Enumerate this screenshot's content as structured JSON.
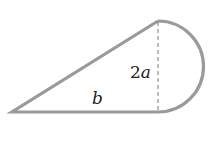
{
  "diagram": {
    "type": "geometric-figure",
    "colors": {
      "stroke": "#9a9a9a",
      "text": "#222222",
      "background": "#ffffff"
    },
    "labels": {
      "height_number": "2",
      "height_var": "a",
      "base": "b"
    },
    "shapes": {
      "triangle": {
        "points": [
          [
            12,
            112
          ],
          [
            158,
            21
          ],
          [
            158,
            112
          ]
        ]
      },
      "semicircle": {
        "center": [
          158,
          66.5
        ],
        "radius": 45.5,
        "side": "right"
      },
      "dashed_height": {
        "from": [
          158,
          21
        ],
        "to": [
          158,
          112
        ]
      }
    }
  }
}
